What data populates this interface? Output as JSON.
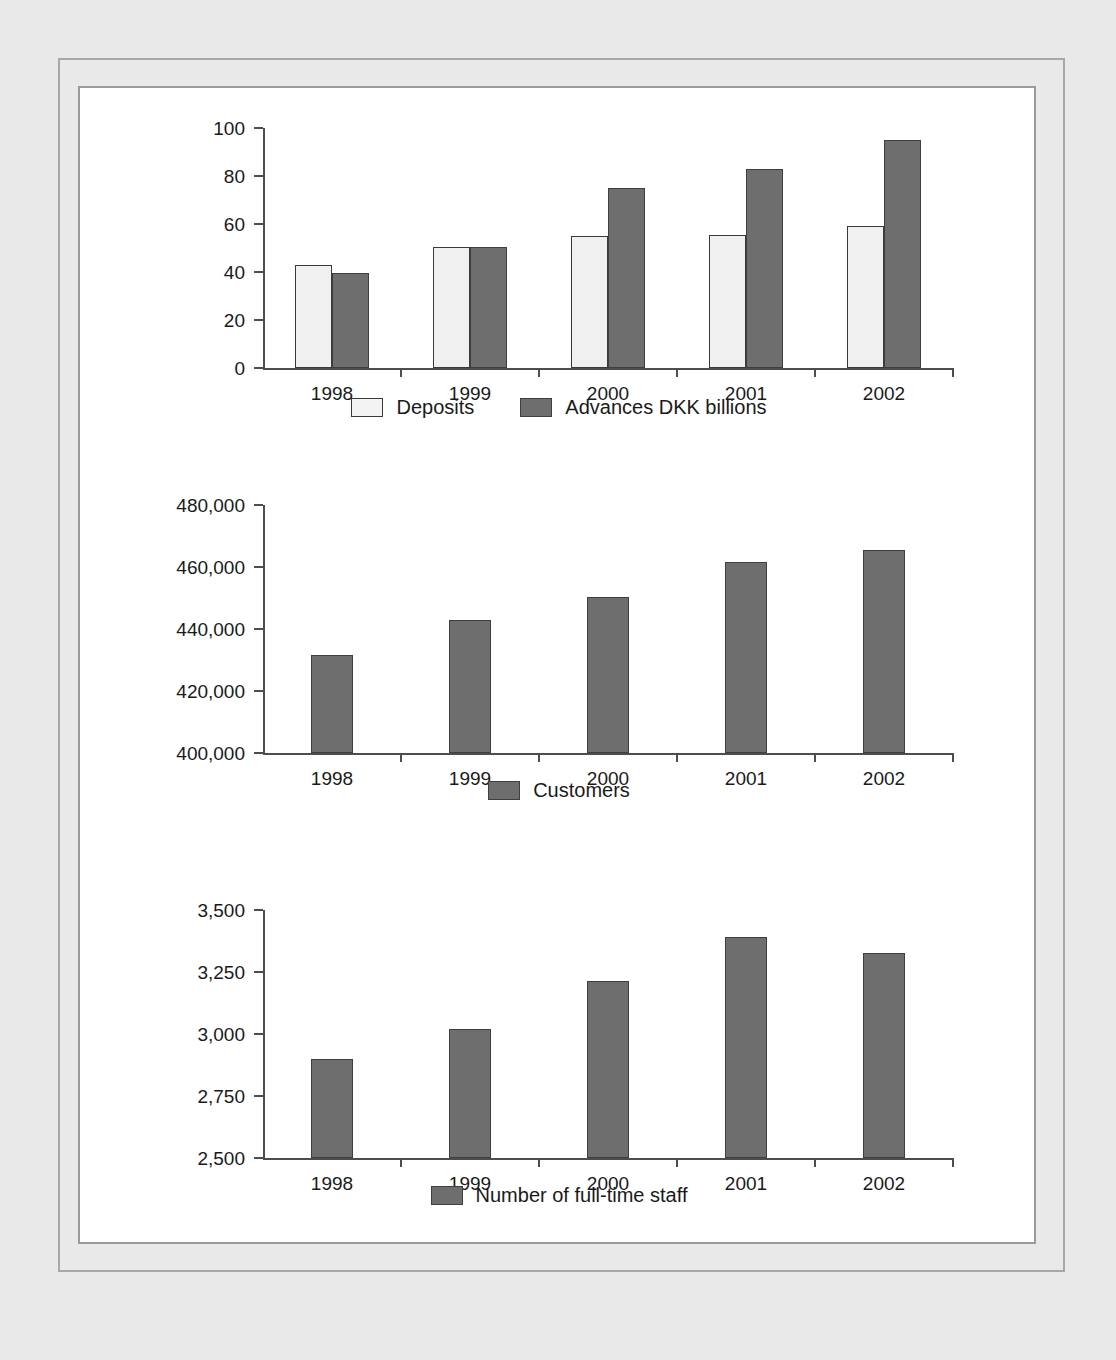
{
  "document": {
    "background_color": "#e9e9e9",
    "frame_color": "#a8a8a8",
    "panel_color": "#ffffff"
  },
  "colors": {
    "series_light": "#f0f0f0",
    "series_dark": "#6e6e6e",
    "axis": "#4d4d4d",
    "text": "#1a1a1a"
  },
  "chart_data": [
    {
      "id": "deposits-advances",
      "type": "bar",
      "title": "",
      "xlabel": "",
      "ylabel": "",
      "categories": [
        "1998",
        "1999",
        "2000",
        "2001",
        "2002"
      ],
      "ylim": [
        0,
        100
      ],
      "yticks": [
        0,
        20,
        40,
        60,
        80,
        100
      ],
      "ytick_labels": [
        "0",
        "20",
        "40",
        "60",
        "80",
        "100"
      ],
      "grid": false,
      "legend_position": "bottom",
      "series": [
        {
          "name": "Deposits",
          "style": "light",
          "values": [
            43,
            50.5,
            55,
            55.5,
            59
          ]
        },
        {
          "name": "Advances DKK billions",
          "style": "dark",
          "values": [
            39.5,
            50.5,
            75,
            83,
            95
          ]
        }
      ]
    },
    {
      "id": "customers",
      "type": "bar",
      "title": "",
      "xlabel": "",
      "ylabel": "",
      "categories": [
        "1998",
        "1999",
        "2000",
        "2001",
        "2002"
      ],
      "ylim": [
        400000,
        480000
      ],
      "yticks": [
        400000,
        420000,
        440000,
        460000,
        480000
      ],
      "ytick_labels": [
        "400,000",
        "420,000",
        "440,000",
        "460,000",
        "480,000"
      ],
      "grid": false,
      "legend_position": "bottom",
      "series": [
        {
          "name": "Customers",
          "style": "dark",
          "values": [
            431500,
            442800,
            450200,
            461500,
            465400
          ]
        }
      ]
    },
    {
      "id": "full-time-staff",
      "type": "bar",
      "title": "",
      "xlabel": "",
      "ylabel": "",
      "categories": [
        "1998",
        "1999",
        "2000",
        "2001",
        "2002"
      ],
      "ylim": [
        2500,
        3500
      ],
      "yticks": [
        2500,
        2750,
        3000,
        3250,
        3500
      ],
      "ytick_labels": [
        "2,500",
        "2,750",
        "3,000",
        "3,250",
        "3,500"
      ],
      "grid": false,
      "legend_position": "bottom",
      "series": [
        {
          "name": "Number of full-time staff",
          "style": "dark",
          "values": [
            2900,
            3020,
            3215,
            3390,
            3325
          ]
        }
      ]
    }
  ]
}
